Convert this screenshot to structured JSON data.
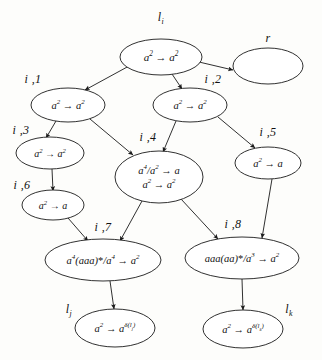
{
  "figure": {
    "type": "directed-graph",
    "background_color": "#fdfdfb",
    "ink_color": "#1a1a1a"
  },
  "nodes": [
    {
      "id": "root",
      "tag": "l_i",
      "tag_html": "l<sub>i</sub>",
      "tag_x": 161,
      "tag_y": 18,
      "cx": 161,
      "cy": 57,
      "rx": 41,
      "ry": 18,
      "lines": [
        "a<sup>2</sup> &#8594; a<sup>2</sup>"
      ],
      "text_plain": "a^2 -> a^2",
      "font_size": 11
    },
    {
      "id": "r",
      "tag": "r",
      "tag_html": "r",
      "tag_x": 268,
      "tag_y": 38,
      "cx": 268,
      "cy": 66,
      "rx": 35,
      "ry": 18,
      "lines": [],
      "text_plain": "",
      "font_size": 11
    },
    {
      "id": "i1",
      "tag": "i ,1",
      "tag_html": "i ,1",
      "tag_x": 33,
      "tag_y": 79,
      "cx": 68,
      "cy": 105,
      "rx": 37,
      "ry": 17,
      "lines": [
        "a<sup>2</sup> &#8594; a<sup>2</sup>"
      ],
      "text_plain": "a^2 -> a^2",
      "font_size": 10.5
    },
    {
      "id": "i2",
      "tag": "i ,2",
      "tag_html": "i ,2",
      "tag_x": 213,
      "tag_y": 79,
      "cx": 190,
      "cy": 105,
      "rx": 37,
      "ry": 17,
      "lines": [
        "a<sup>2</sup> &#8594; a<sup>2</sup>"
      ],
      "text_plain": "a^2 -> a^2",
      "font_size": 10.5
    },
    {
      "id": "i3",
      "tag": "i ,3",
      "tag_html": "i ,3",
      "tag_x": 21,
      "tag_y": 130,
      "cx": 50,
      "cy": 153,
      "rx": 34,
      "ry": 16,
      "lines": [
        "a<sup>2</sup> &#8594; a<sup>2</sup>"
      ],
      "text_plain": "a^2 -> a^2",
      "font_size": 10
    },
    {
      "id": "i4",
      "tag": "i ,4",
      "tag_html": "i ,4",
      "tag_x": 148,
      "tag_y": 137,
      "cx": 159,
      "cy": 177,
      "rx": 44,
      "ry": 26,
      "lines": [
        "a<sup>4</sup>/a<sup>2</sup> &#8594; a",
        "a<sup>2</sup> &#8594; a<sup>2</sup>"
      ],
      "text_plain": "a^4/a^2 -> a ; a^2 -> a^2",
      "font_size": 10.5
    },
    {
      "id": "i5",
      "tag": "i ,5",
      "tag_html": "i ,5",
      "tag_x": 268,
      "tag_y": 132,
      "cx": 268,
      "cy": 163,
      "rx": 33,
      "ry": 16,
      "lines": [
        "a<sup>2</sup> &#8594; a"
      ],
      "text_plain": "a^2 -> a",
      "font_size": 10.5
    },
    {
      "id": "i6",
      "tag": "i ,6",
      "tag_html": "i ,6",
      "tag_x": 22,
      "tag_y": 185,
      "cx": 53,
      "cy": 205,
      "rx": 31,
      "ry": 15,
      "lines": [
        "a<sup>2</sup> &#8594; a"
      ],
      "text_plain": "a^2 -> a",
      "font_size": 10
    },
    {
      "id": "i7",
      "tag": "i ,7",
      "tag_html": "i ,7",
      "tag_x": 103,
      "tag_y": 227,
      "cx": 103,
      "cy": 260,
      "rx": 58,
      "ry": 21,
      "lines": [
        "a<sup>4</sup>(aaa)<span class=\"star\">*</span>/a<sup>4</sup> &#8594; a<sup>2</sup>"
      ],
      "text_plain": "a^4(aaa)*/a^4 -> a^2",
      "font_size": 10.5
    },
    {
      "id": "i8",
      "tag": "i ,8",
      "tag_html": "i ,8",
      "tag_x": 233,
      "tag_y": 224,
      "cx": 242,
      "cy": 258,
      "rx": 57,
      "ry": 21,
      "lines": [
        "aaa(aa)<span class=\"star\">*</span>/a<sup>3</sup> &#8594; a<sup>2</sup>"
      ],
      "text_plain": "aaa(aa)*/a^3 -> a^2",
      "font_size": 10.5
    },
    {
      "id": "lj",
      "tag": "l_j",
      "tag_html": "l<sub>j</sub>",
      "tag_x": 69,
      "tag_y": 310,
      "cx": 115,
      "cy": 328,
      "rx": 40,
      "ry": 19,
      "lines": [
        "a<sup>2</sup> &#8594; a<sup>&#948;(l<sub>j</sub>)</sup>"
      ],
      "text_plain": "a^2 -> a^delta(l_j)",
      "font_size": 10.5
    },
    {
      "id": "lk",
      "tag": "l_k",
      "tag_html": "l<sub>k</sub>",
      "tag_x": 289,
      "tag_y": 310,
      "cx": 243,
      "cy": 329,
      "rx": 40,
      "ry": 19,
      "lines": [
        "a<sup>2</sup> &#8594; a<sup>&#948;(l<sub>k</sub>)</sup>"
      ],
      "text_plain": "a^2 -> a^delta(l_k)",
      "font_size": 10.5
    }
  ],
  "edges": [
    {
      "id": "e-root-i1",
      "from": "root",
      "to": "i1",
      "x1": 129,
      "y1": 66,
      "x2": 85,
      "y2": 90,
      "arrow": true
    },
    {
      "id": "e-root-r",
      "from": "root",
      "to": "r",
      "x1": 199,
      "y1": 62,
      "x2": 233,
      "y2": 70,
      "arrow": true
    },
    {
      "id": "e-root-i2",
      "from": "root",
      "to": "i2",
      "x1": 172,
      "y1": 74,
      "x2": 182,
      "y2": 89,
      "arrow": true
    },
    {
      "id": "e-i1-i3",
      "from": "i1",
      "to": "i3",
      "x1": 56,
      "y1": 121,
      "x2": 46,
      "y2": 138,
      "arrow": true
    },
    {
      "id": "e-i1-i4",
      "from": "i1",
      "to": "i4",
      "x1": 90,
      "y1": 119,
      "x2": 133,
      "y2": 155,
      "arrow": true
    },
    {
      "id": "e-i2-i4",
      "from": "i2",
      "to": "i4",
      "x1": 176,
      "y1": 121,
      "x2": 163,
      "y2": 152,
      "arrow": true
    },
    {
      "id": "e-i2-i5",
      "from": "i2",
      "to": "i5",
      "x1": 218,
      "y1": 117,
      "x2": 255,
      "y2": 148,
      "arrow": true
    },
    {
      "id": "e-i3-i6",
      "from": "i3",
      "to": "i6",
      "x1": 52,
      "y1": 169,
      "x2": 53,
      "y2": 191,
      "arrow": true
    },
    {
      "id": "e-i6-i7",
      "from": "i6",
      "to": "i7",
      "x1": 68,
      "y1": 218,
      "x2": 88,
      "y2": 241,
      "arrow": true
    },
    {
      "id": "e-i4-i7",
      "from": "i4",
      "to": "i7",
      "x1": 142,
      "y1": 201,
      "x2": 120,
      "y2": 241,
      "arrow": true
    },
    {
      "id": "e-i4-i8",
      "from": "i4",
      "to": "i8",
      "x1": 181,
      "y1": 199,
      "x2": 218,
      "y2": 239,
      "arrow": true
    },
    {
      "id": "e-i5-i8",
      "from": "i5",
      "to": "i8",
      "x1": 272,
      "y1": 179,
      "x2": 262,
      "y2": 238,
      "arrow": true
    },
    {
      "id": "e-i7-lj",
      "from": "i7",
      "to": "lj",
      "x1": 110,
      "y1": 281,
      "x2": 114,
      "y2": 309,
      "arrow": true
    },
    {
      "id": "e-i8-lk",
      "from": "i8",
      "to": "lk",
      "x1": 242,
      "y1": 279,
      "x2": 243,
      "y2": 310,
      "arrow": true
    }
  ]
}
